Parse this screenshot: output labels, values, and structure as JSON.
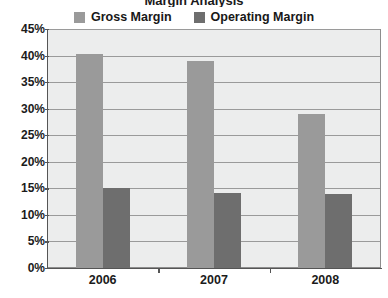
{
  "chart_data": {
    "type": "bar",
    "title": "Margin Analysis",
    "title_clipped": true,
    "xlabel": "",
    "ylabel": "",
    "categories": [
      "2006",
      "2007",
      "2008"
    ],
    "series": [
      {
        "name": "Gross Margin",
        "values": [
          40.3,
          39.0,
          29.0
        ],
        "color": "#9a9a9a"
      },
      {
        "name": "Operating Margin",
        "values": [
          15.0,
          14.2,
          13.9
        ],
        "color": "#6e6e6e"
      }
    ],
    "ylim": [
      0,
      45
    ],
    "ytick_labels": [
      "45%",
      "40%",
      "35%",
      "30%",
      "25%",
      "20%",
      "15%",
      "10%",
      "5%",
      "0%"
    ],
    "ytick_values": [
      45,
      40,
      35,
      30,
      25,
      20,
      15,
      10,
      5,
      0
    ],
    "grid": true,
    "legend_position": "top",
    "plot_background": "#eceded",
    "axis_color": "#555555",
    "grid_color": "#9a9a9a"
  },
  "legend": {
    "items": [
      {
        "label": "Gross Margin",
        "color": "#9a9a9a",
        "swatch_name": "legend-swatch-gross-margin"
      },
      {
        "label": "Operating Margin",
        "color": "#6e6e6e",
        "swatch_name": "legend-swatch-operating-margin"
      }
    ]
  }
}
